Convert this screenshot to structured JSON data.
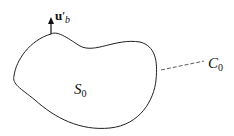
{
  "diagram": {
    "vector_label": {
      "base": "u",
      "prime": "′",
      "sub": "b"
    },
    "region_label": {
      "base": "S",
      "sub": "0"
    },
    "curve_label": {
      "base": "C",
      "sub": "0"
    }
  },
  "colors": {
    "stroke": "#222222",
    "background": "#ffffff"
  }
}
